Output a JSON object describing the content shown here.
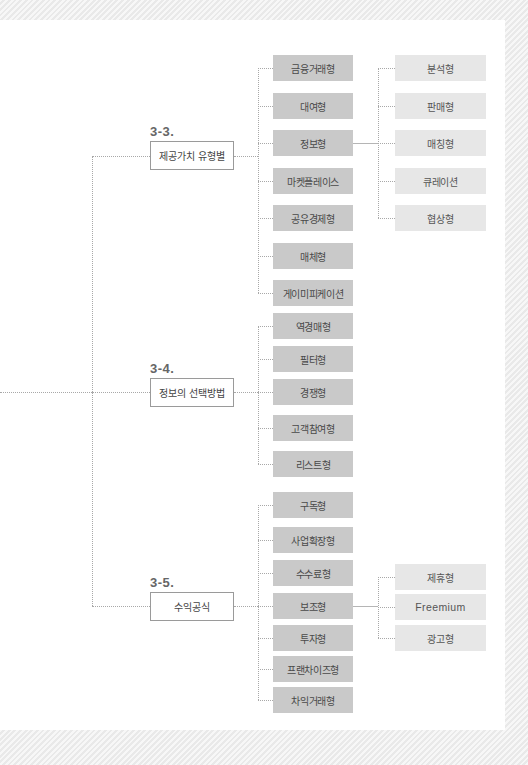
{
  "diagram": {
    "categories": [
      {
        "id": "3-3",
        "number": "3-3.",
        "label": "제공가치 유형별",
        "children": [
          {
            "label": "금융거래형"
          },
          {
            "label": "대여형"
          },
          {
            "label": "정보형",
            "children": [
              {
                "label": "분석형"
              },
              {
                "label": "판매형"
              },
              {
                "label": "매칭형"
              },
              {
                "label": "큐레이션"
              },
              {
                "label": "협상형"
              }
            ]
          },
          {
            "label": "마켓플레이스"
          },
          {
            "label": "공유경제형"
          },
          {
            "label": "매체형"
          },
          {
            "label": "게이미피케이션"
          }
        ]
      },
      {
        "id": "3-4",
        "number": "3-4.",
        "label": "정보의 선택방법",
        "children": [
          {
            "label": "역경매형"
          },
          {
            "label": "필터형"
          },
          {
            "label": "경쟁형"
          },
          {
            "label": "고객참여형"
          },
          {
            "label": "리스트형"
          }
        ]
      },
      {
        "id": "3-5",
        "number": "3-5.",
        "label": "수익공식",
        "children": [
          {
            "label": "구독형"
          },
          {
            "label": "사업확장형"
          },
          {
            "label": "수수료형"
          },
          {
            "label": "보조형",
            "children": [
              {
                "label": "제휴형"
              },
              {
                "label": "Freemium"
              },
              {
                "label": "광고형"
              }
            ]
          },
          {
            "label": "투자형"
          },
          {
            "label": "프랜차이즈형"
          },
          {
            "label": "차익거래형"
          }
        ]
      }
    ]
  },
  "colors": {
    "level2_box": "#c9c9c9",
    "level3_box": "#e7e7e7",
    "connector": "#a8a8a8",
    "category_border": "#9a9a9a"
  }
}
